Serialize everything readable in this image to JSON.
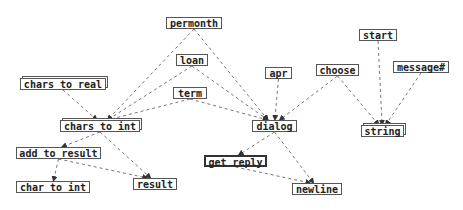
{
  "diagram": {
    "type": "dependency-graph",
    "edge_style": "dashed",
    "colors": {
      "edge": "#777777",
      "node_border": "#555555",
      "text": "#222222",
      "background": "#ffffff"
    },
    "nodes": [
      {
        "id": "permonth",
        "label": "permonth",
        "x": 166,
        "y": 17,
        "w": 56,
        "h": 12,
        "style": "plain"
      },
      {
        "id": "loan",
        "label": "loan",
        "x": 176,
        "y": 54,
        "w": 32,
        "h": 12,
        "style": "plain"
      },
      {
        "id": "chars_to_real",
        "label": "chars to real",
        "x": 20,
        "y": 78,
        "w": 86,
        "h": 12,
        "style": "stacked"
      },
      {
        "id": "term",
        "label": "term",
        "x": 173,
        "y": 87,
        "w": 34,
        "h": 12,
        "style": "plain"
      },
      {
        "id": "apr",
        "label": "apr",
        "x": 265,
        "y": 67,
        "w": 27,
        "h": 12,
        "style": "plain"
      },
      {
        "id": "choose",
        "label": "choose",
        "x": 316,
        "y": 64,
        "w": 43,
        "h": 12,
        "style": "plain"
      },
      {
        "id": "start",
        "label": "start",
        "x": 359,
        "y": 29,
        "w": 38,
        "h": 12,
        "style": "plain"
      },
      {
        "id": "message",
        "label": "message#",
        "x": 393,
        "y": 61,
        "w": 56,
        "h": 12,
        "style": "plain"
      },
      {
        "id": "chars_to_int",
        "label": "chars to int",
        "x": 60,
        "y": 120,
        "w": 80,
        "h": 12,
        "style": "stacked"
      },
      {
        "id": "dialog",
        "label": "dialog",
        "x": 252,
        "y": 120,
        "w": 45,
        "h": 12,
        "style": "plain"
      },
      {
        "id": "string",
        "label": "string",
        "x": 361,
        "y": 125,
        "w": 43,
        "h": 12,
        "style": "stacked"
      },
      {
        "id": "add_to_result",
        "label": "add to result",
        "x": 16,
        "y": 147,
        "w": 85,
        "h": 12,
        "style": "plain"
      },
      {
        "id": "get_reply",
        "label": "get reply",
        "x": 204,
        "y": 155,
        "w": 63,
        "h": 12,
        "style": "bold"
      },
      {
        "id": "char_to_int",
        "label": "char to int",
        "x": 16,
        "y": 181,
        "w": 74,
        "h": 12,
        "style": "plain"
      },
      {
        "id": "result",
        "label": "result",
        "x": 133,
        "y": 178,
        "w": 44,
        "h": 12,
        "style": "plain"
      },
      {
        "id": "newline",
        "label": "newline",
        "x": 292,
        "y": 183,
        "w": 50,
        "h": 12,
        "style": "plain"
      }
    ],
    "edges": [
      {
        "from": "permonth",
        "to": "chars_to_int"
      },
      {
        "from": "permonth",
        "to": "dialog"
      },
      {
        "from": "loan",
        "to": "chars_to_int"
      },
      {
        "from": "loan",
        "to": "dialog"
      },
      {
        "from": "term",
        "to": "chars_to_int"
      },
      {
        "from": "term",
        "to": "dialog"
      },
      {
        "from": "chars_to_real",
        "to": "chars_to_int"
      },
      {
        "from": "apr",
        "to": "dialog"
      },
      {
        "from": "choose",
        "to": "dialog"
      },
      {
        "from": "choose",
        "to": "string"
      },
      {
        "from": "start",
        "to": "string"
      },
      {
        "from": "message",
        "to": "string"
      },
      {
        "from": "chars_to_int",
        "to": "add_to_result"
      },
      {
        "from": "chars_to_int",
        "to": "result"
      },
      {
        "from": "add_to_result",
        "to": "char_to_int"
      },
      {
        "from": "add_to_result",
        "to": "result"
      },
      {
        "from": "dialog",
        "to": "get_reply"
      },
      {
        "from": "dialog",
        "to": "newline"
      },
      {
        "from": "get_reply",
        "to": "newline"
      }
    ]
  }
}
